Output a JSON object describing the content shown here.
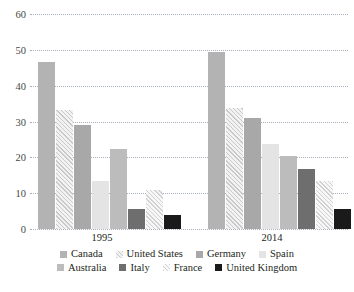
{
  "chart_data": {
    "type": "bar",
    "title": "",
    "subtitle": "",
    "xlabel": "",
    "ylabel": "",
    "categories": [
      "1995",
      "2014"
    ],
    "ylim": [
      0,
      60
    ],
    "yticks": [
      0,
      10,
      20,
      30,
      40,
      50,
      60
    ],
    "ytick_labels": [
      "0",
      "10",
      "20",
      "30",
      "40",
      "50",
      "60"
    ],
    "grid": true,
    "grid_axis": "y",
    "grid_style": "dotted",
    "legend_position": "bottom",
    "legend_columns": 4,
    "series": [
      {
        "name": "Canada",
        "values": [
          46.5,
          49.5
        ],
        "color": "#b3b3b3",
        "pattern": "solid"
      },
      {
        "name": "United States",
        "values": [
          33.2,
          33.7
        ],
        "color": "#ededed",
        "pattern": "diagonal-hatch"
      },
      {
        "name": "Germany",
        "values": [
          29.0,
          31.0
        ],
        "color": "#a8a8a8",
        "pattern": "solid"
      },
      {
        "name": "Spain",
        "values": [
          13.3,
          23.6
        ],
        "color": "#e4e4e4",
        "pattern": "solid"
      },
      {
        "name": "Australia",
        "values": [
          22.3,
          20.4
        ],
        "color": "#bcbcbc",
        "pattern": "solid"
      },
      {
        "name": "Italy",
        "values": [
          5.6,
          16.7
        ],
        "color": "#6e6e6e",
        "pattern": "solid"
      },
      {
        "name": "France",
        "values": [
          11.0,
          13.3
        ],
        "color": "#f0f0f0",
        "pattern": "diagonal-hatch"
      },
      {
        "name": "United Kingdom",
        "values": [
          4.0,
          5.5
        ],
        "color": "#1a1a1a",
        "pattern": "solid"
      }
    ]
  },
  "axis": {
    "y": {
      "t60": "60",
      "t50": "50",
      "t40": "40",
      "t30": "30",
      "t20": "20",
      "t10": "10",
      "t0": "0"
    },
    "x": {
      "c0": "1995",
      "c1": "2014"
    }
  },
  "legend": {
    "row1": [
      {
        "label": "Canada"
      },
      {
        "label": "United States"
      },
      {
        "label": "Germany"
      },
      {
        "label": "Spain"
      }
    ],
    "row2": [
      {
        "label": "Australia"
      },
      {
        "label": "Italy"
      },
      {
        "label": "France"
      },
      {
        "label": "United Kingdom"
      }
    ]
  }
}
